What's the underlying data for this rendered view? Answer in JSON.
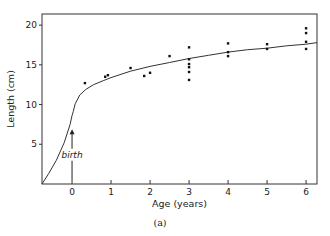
{
  "chart_data": {
    "type": "scatter",
    "title": "",
    "xlabel": "Age (years)",
    "ylabel": "Length (cm)",
    "caption": "(a)",
    "xlim": [
      -0.77,
      6.28
    ],
    "ylim": [
      0,
      21.4
    ],
    "x_ticks": [
      0,
      1,
      2,
      3,
      4,
      5,
      6
    ],
    "x_tick_labels": [
      "0",
      "1",
      "2",
      "3",
      "4",
      "5",
      "6"
    ],
    "y_ticks": [
      5,
      10,
      15,
      20
    ],
    "y_tick_labels": [
      "5",
      "10",
      "15",
      "20"
    ],
    "grid": false,
    "legend": "none",
    "annotations": [
      {
        "text": "birth",
        "x": 0,
        "y": 3.3,
        "arrow_to": [
          0,
          6.9
        ]
      }
    ],
    "series": [
      {
        "name": "observations",
        "kind": "points",
        "points": [
          [
            0.33,
            12.7
          ],
          [
            0.85,
            13.5
          ],
          [
            0.92,
            13.7
          ],
          [
            1.5,
            14.6
          ],
          [
            1.85,
            13.6
          ],
          [
            2.0,
            14.0
          ],
          [
            2.5,
            16.1
          ],
          [
            3.0,
            17.2
          ],
          [
            3.0,
            15.7
          ],
          [
            3.0,
            15.1
          ],
          [
            3.0,
            14.7
          ],
          [
            3.0,
            14.1
          ],
          [
            3.0,
            13.1
          ],
          [
            4.0,
            17.7
          ],
          [
            4.0,
            16.6
          ],
          [
            4.0,
            16.1
          ],
          [
            5.0,
            17.6
          ],
          [
            5.0,
            17.0
          ],
          [
            6.0,
            19.6
          ],
          [
            6.0,
            19.0
          ],
          [
            6.0,
            17.9
          ],
          [
            6.0,
            17.0
          ]
        ]
      },
      {
        "name": "growth curve",
        "kind": "line",
        "points": [
          [
            -0.77,
            0
          ],
          [
            -0.6,
            1.3
          ],
          [
            -0.4,
            3.0
          ],
          [
            -0.2,
            5.2
          ],
          [
            -0.05,
            7.5
          ],
          [
            0.0,
            8.6
          ],
          [
            0.03,
            9.1
          ],
          [
            0.08,
            10.1
          ],
          [
            0.2,
            11.2
          ],
          [
            0.35,
            11.9
          ],
          [
            0.55,
            12.5
          ],
          [
            0.8,
            13.0
          ],
          [
            1.0,
            13.4
          ],
          [
            1.5,
            14.2
          ],
          [
            2.0,
            14.8
          ],
          [
            2.5,
            15.3
          ],
          [
            3.0,
            15.8
          ],
          [
            3.5,
            16.2
          ],
          [
            4.0,
            16.6
          ],
          [
            4.5,
            16.9
          ],
          [
            5.0,
            17.1
          ],
          [
            5.5,
            17.4
          ],
          [
            6.0,
            17.6
          ],
          [
            6.28,
            17.8
          ]
        ],
        "gap": [
          0.03,
          0.08
        ]
      }
    ]
  }
}
